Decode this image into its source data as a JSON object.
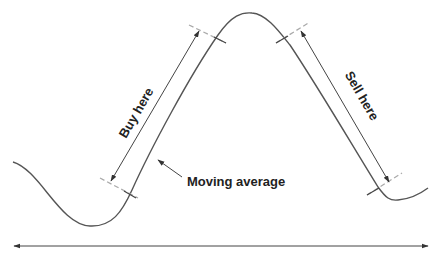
{
  "diagram": {
    "labels": {
      "buy": "Buy here",
      "sell": "Sell here",
      "moving_average": "Moving average"
    },
    "colors": {
      "curve": "#555555",
      "arrow": "#444444",
      "dashed": "#aaaaaa",
      "tick": "#555555",
      "text": "#222222"
    },
    "elements": [
      "moving-average-curve",
      "buy-arrow",
      "sell-arrow",
      "buy-dashed-markers",
      "sell-dashed-markers",
      "moving-average-pointer",
      "time-axis-double-arrow"
    ]
  }
}
